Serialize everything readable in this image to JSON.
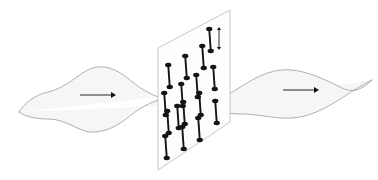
{
  "figure": {
    "title": "Polarization of a light wave passing through a polarizing medium",
    "background_color": "#ffffff",
    "width": 378,
    "height": 180
  },
  "colors": {
    "wave_stroke": "#8f8f96",
    "wave_fill": "#f6f6f7",
    "plane_stroke": "#b9b9bd",
    "plane_fill": "#fdfdfd",
    "molecule_fill": "#141414",
    "arrow_color": "#111111",
    "polarization_arrow_color": "#141414"
  },
  "incoming_wave": {
    "name": "incoming-unpolarized-wave",
    "label": "incoming wave",
    "axis_y": 96,
    "x_start": 16,
    "x_end": 178,
    "envelope_amplitude": 30,
    "lobes": 2,
    "fill": "#f6f6f7",
    "stroke": "#8f8f96",
    "stroke_width": 0.7,
    "path_front": "M 19,112 C 24,104 34,95 48,92 C 66,88 78,74 90,69 C 104,63 118,70 130,80 C 142,90 156,98 172,101 C 178,102 182,103 186,105",
    "path_back": "M 19,112 C 24,116 34,119 48,119 C 66,119 78,131 90,132 C 104,133 118,126 130,116 C 142,106 156,99 172,97 C 178,96 182,95 186,94"
  },
  "outgoing_wave": {
    "name": "outgoing-polarized-wave",
    "label": "outgoing wave",
    "axis_y": 86,
    "x_start": 192,
    "x_end": 372,
    "envelope_amplitude": 28,
    "lobes": 1,
    "fill": "#f6f6f7",
    "stroke": "#8f8f96",
    "stroke_width": 0.7,
    "path_front": "M 196,107 C 212,104 226,96 242,86 C 258,76 274,68 292,70 C 310,72 326,80 342,88 C 354,94 364,88 372,80",
    "path_back": "M 196,107 C 212,111 226,114 242,114 C 258,114 274,119 292,118 C 310,117 326,108 342,98 C 354,90 364,84 372,80"
  },
  "direction_arrows": [
    {
      "name": "incoming-direction-arrow",
      "label": "propagation direction (incoming)",
      "x1": 80,
      "y1": 95,
      "x2": 116,
      "y2": 95,
      "head_size": 5,
      "color": "#111111"
    },
    {
      "name": "outgoing-direction-arrow",
      "label": "propagation direction (outgoing)",
      "x1": 283,
      "y1": 90,
      "x2": 319,
      "y2": 90,
      "head_size": 5,
      "color": "#111111"
    }
  ],
  "polarizer_plane": {
    "name": "polarizer-plane",
    "label": "polarizing filter plane",
    "fill": "#fdfdfd",
    "stroke": "#b9b9bd",
    "stroke_width": 0.8,
    "corners": {
      "top_left": [
        158,
        48
      ],
      "top_right": [
        230,
        10
      ],
      "bottom_right": [
        230,
        122
      ],
      "bottom_left": [
        158,
        170
      ]
    },
    "polygon_points": "158,48 230,10 230,122 158,170"
  },
  "polarization_indicator": {
    "name": "polarization-axis-arrow",
    "label": "molecular alignment axis (vertical double arrow)",
    "x": 219,
    "y_top": 27,
    "y_bottom": 50,
    "head_size": 3,
    "color": "#141414"
  },
  "molecules": {
    "name": "molecule-grid",
    "label": "aligned long-chain molecules",
    "count": 16,
    "columns": 4,
    "rows": 4,
    "shape": "dumbbell",
    "fill": "#141414",
    "bar_width": 1.9,
    "node_rx": 3.2,
    "node_ry": 2.3,
    "tilt_deg": -4,
    "items": [
      {
        "id": "m-r1c1",
        "cx": 169,
        "cy": 76,
        "half_len": 11
      },
      {
        "id": "m-r1c2",
        "cx": 186,
        "cy": 67,
        "half_len": 11
      },
      {
        "id": "m-r1c3",
        "cx": 203,
        "cy": 57,
        "half_len": 11
      },
      {
        "id": "m-r1c4",
        "cx": 210,
        "cy": 40,
        "half_len": 11
      },
      {
        "id": "m-r2c1",
        "cx": 165,
        "cy": 104,
        "half_len": 11
      },
      {
        "id": "m-r2c2",
        "cx": 182,
        "cy": 95,
        "half_len": 11
      },
      {
        "id": "m-r2c3",
        "cx": 197,
        "cy": 86,
        "half_len": 11
      },
      {
        "id": "m-r2c4",
        "cx": 214,
        "cy": 78,
        "half_len": 11
      },
      {
        "id": "m-r3c1",
        "cx": 168,
        "cy": 122,
        "half_len": 11
      },
      {
        "id": "m-r3c2",
        "cx": 184,
        "cy": 113,
        "half_len": 11
      },
      {
        "id": "m-r3c3",
        "cx": 200,
        "cy": 104,
        "half_len": 11
      },
      {
        "id": "m-r3c4",
        "cx": 216,
        "cy": 112,
        "half_len": 11
      },
      {
        "id": "m-r4c1",
        "cx": 166,
        "cy": 147,
        "half_len": 11
      },
      {
        "id": "m-r4c2",
        "cx": 183,
        "cy": 138,
        "half_len": 11
      },
      {
        "id": "m-r4c3",
        "cx": 199,
        "cy": 129,
        "half_len": 11
      },
      {
        "id": "m-r4c4",
        "cx": 178,
        "cy": 117,
        "half_len": 11
      }
    ]
  }
}
